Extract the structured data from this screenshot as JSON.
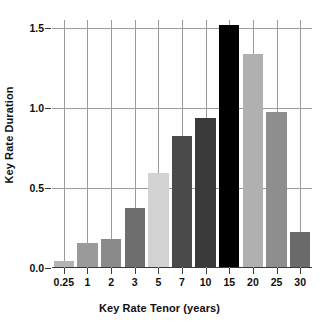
{
  "chart_data": {
    "type": "bar",
    "title": "",
    "xlabel": "Key Rate Tenor (years)",
    "ylabel": "Key Rate Duration",
    "categories": [
      "0.25",
      "1",
      "2",
      "3",
      "5",
      "7",
      "10",
      "15",
      "20",
      "25",
      "30"
    ],
    "values": [
      0.04,
      0.15,
      0.175,
      0.37,
      0.59,
      0.82,
      0.93,
      1.51,
      1.33,
      0.97,
      0.22
    ],
    "bar_colors": [
      "#b4b4b4",
      "#9a9a9a",
      "#8a8a8a",
      "#6e6e6e",
      "#d2d2d2",
      "#4a4a4a",
      "#3a3a3a",
      "#000000",
      "#b0b0b0",
      "#8e8e8e",
      "#6a6a6a"
    ],
    "ylim": [
      0.0,
      1.55
    ],
    "yticks": [
      0.0,
      0.5,
      1.0,
      1.5
    ],
    "ytick_labels": [
      "0.0",
      "0.5",
      "1.0",
      "1.5"
    ],
    "grid": "both",
    "grid_color": "#9a9a9a",
    "legend": "none",
    "axis_color": "#3a3a3a",
    "text_color": "#101010",
    "background": "#fefefe"
  }
}
